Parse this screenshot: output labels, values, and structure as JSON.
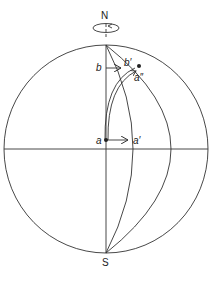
{
  "diagram": {
    "type": "earth-rotation-coriolis",
    "labels": {
      "north": "N",
      "south": "S",
      "a": "a",
      "a_prime": "a′",
      "a_double_prime": "a″",
      "b": "b",
      "b_prime": "b′"
    },
    "colors": {
      "line": "#333333",
      "background": "#ffffff"
    }
  }
}
